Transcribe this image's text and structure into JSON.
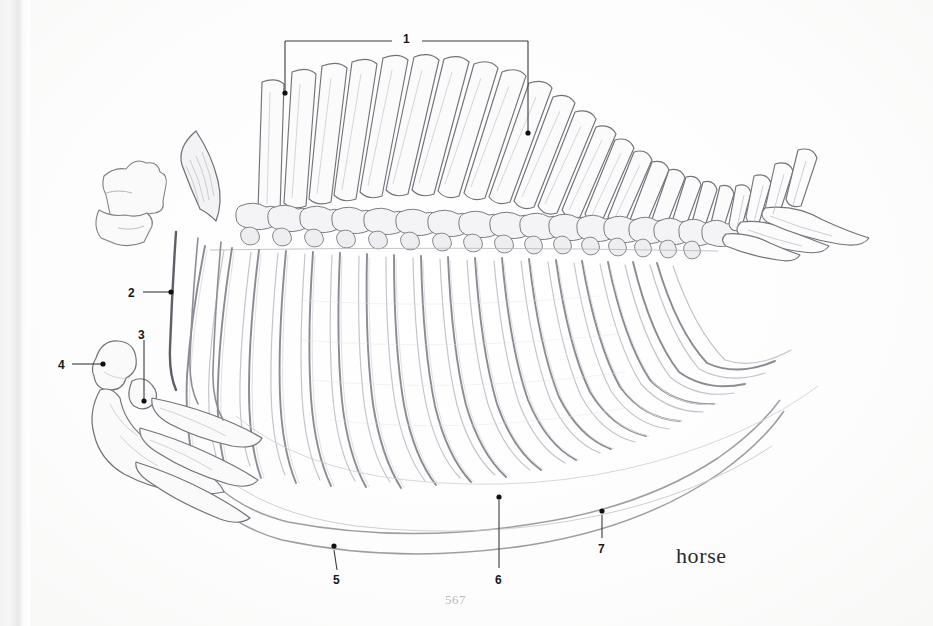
{
  "page": {
    "folio": "567",
    "caption": "horse",
    "background_color": "#fdfdfd",
    "ink_color": "#7b7b80",
    "label_color": "#18181a",
    "leader_color": "#3a3a3e",
    "folio_color": "#b9b9b9"
  },
  "figure": {
    "medium": "pencil illustration"
  },
  "callouts": [
    {
      "id": "1",
      "label": "1",
      "style": "bracket",
      "label_x": 403,
      "label_y": 33,
      "bracket": {
        "y": 41,
        "x_left": 285,
        "x_right": 528,
        "text_gap_left": 392,
        "text_gap_right": 422
      },
      "points": [
        {
          "x": 285,
          "y": 93
        },
        {
          "x": 528,
          "y": 133
        }
      ]
    },
    {
      "id": "2",
      "label": "2",
      "style": "leader",
      "label_x": 128,
      "label_y": 287,
      "leader": {
        "x1": 143,
        "y1": 292,
        "x2": 170,
        "y2": 292
      },
      "points": [
        {
          "x": 171,
          "y": 292
        }
      ]
    },
    {
      "id": "3",
      "label": "3",
      "style": "leader",
      "label_x": 138,
      "label_y": 329,
      "leader": {
        "x1": 144,
        "y1": 340,
        "x2": 144,
        "y2": 400
      },
      "points": [
        {
          "x": 144,
          "y": 401
        }
      ]
    },
    {
      "id": "4",
      "label": "4",
      "style": "leader",
      "label_x": 58,
      "label_y": 359,
      "leader": {
        "x1": 72,
        "y1": 364,
        "x2": 102,
        "y2": 364
      },
      "points": [
        {
          "x": 103,
          "y": 364
        }
      ]
    },
    {
      "id": "5",
      "label": "5",
      "style": "leader",
      "label_x": 333,
      "label_y": 574,
      "leader": {
        "x1": 337,
        "y1": 570,
        "x2": 334,
        "y2": 549
      },
      "points": [
        {
          "x": 334,
          "y": 546
        }
      ]
    },
    {
      "id": "6",
      "label": "6",
      "style": "leader",
      "label_x": 495,
      "label_y": 574,
      "leader": {
        "x1": 499,
        "y1": 568,
        "x2": 499,
        "y2": 500
      },
      "points": [
        {
          "x": 499,
          "y": 497
        }
      ]
    },
    {
      "id": "7",
      "label": "7",
      "style": "leader",
      "label_x": 598,
      "label_y": 543,
      "leader": {
        "x1": 602,
        "y1": 538,
        "x2": 602,
        "y2": 514
      },
      "points": [
        {
          "x": 602,
          "y": 511
        }
      ]
    }
  ],
  "caption_pos": {
    "x": 676,
    "y": 543
  },
  "folio_pos": {
    "x": 445,
    "y": 592
  }
}
